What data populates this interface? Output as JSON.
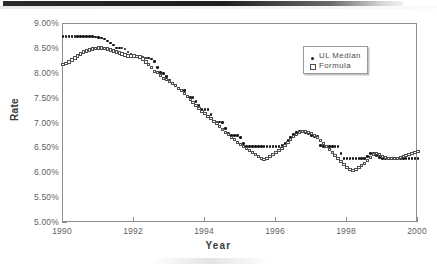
{
  "artifact": {
    "top_band": "scan-shadow-band"
  },
  "chart_data": {
    "type": "scatter",
    "title": "",
    "xlabel": "Year",
    "ylabel": "Rate",
    "xlim": [
      1990,
      2000
    ],
    "ylim": [
      5.0,
      9.0
    ],
    "ytick_labels": [
      "9.00%",
      "8.50%",
      "8.00%",
      "7.50%",
      "7.00%",
      "6.50%",
      "6.00%",
      "5.50%",
      "5.00%"
    ],
    "ytick_values": [
      9.0,
      8.5,
      8.0,
      7.5,
      7.0,
      6.5,
      6.0,
      5.5,
      5.0
    ],
    "xtick_labels": [
      "1990",
      "1992",
      "1994",
      "1996",
      "1998",
      "2000"
    ],
    "xtick_values": [
      1990,
      1992,
      1994,
      1996,
      1998,
      2000
    ],
    "grid": false,
    "legend_position": "upper-right",
    "y_unit": "percent",
    "x_step_months": 1,
    "series": [
      {
        "name": "UL Median",
        "marker": "filled-circle",
        "color": "#141414",
        "x_start": 1990.0,
        "values": [
          8.75,
          8.75,
          8.75,
          8.75,
          8.75,
          8.75,
          8.75,
          8.75,
          8.75,
          8.75,
          8.75,
          8.74,
          8.73,
          8.72,
          8.7,
          8.66,
          8.62,
          8.58,
          8.52,
          8.52,
          8.52,
          8.5,
          8.44,
          8.4,
          8.36,
          8.34,
          8.34,
          8.33,
          8.32,
          8.32,
          8.3,
          8.25,
          8.12,
          8.02,
          8.0,
          7.94,
          7.86,
          7.8,
          7.76,
          7.7,
          7.66,
          7.66,
          7.54,
          7.52,
          7.52,
          7.44,
          7.36,
          7.28,
          7.28,
          7.28,
          7.18,
          7.04,
          7.03,
          7.03,
          7.02,
          6.9,
          6.8,
          6.76,
          6.76,
          6.76,
          6.72,
          6.6,
          6.54,
          6.54,
          6.54,
          6.54,
          6.54,
          6.54,
          6.54,
          6.54,
          6.54,
          6.54,
          6.54,
          6.54,
          6.56,
          6.6,
          6.66,
          6.72,
          6.78,
          6.82,
          6.84,
          6.84,
          6.82,
          6.8,
          6.76,
          6.74,
          6.74,
          6.56,
          6.54,
          6.54,
          6.54,
          6.54,
          6.54,
          6.54,
          6.4,
          6.3,
          6.3,
          6.3,
          6.3,
          6.3,
          6.3,
          6.3,
          6.3,
          6.34,
          6.4,
          6.4,
          6.36,
          6.32,
          6.3,
          6.3,
          6.3,
          6.3,
          6.3,
          6.3,
          6.3,
          6.3,
          6.3,
          6.3,
          6.3,
          6.3,
          6.3,
          6.3,
          6.3,
          6.3,
          6.3,
          6.26,
          6.16,
          6.16,
          6.06,
          6.06,
          6.06,
          6.06,
          6.06,
          6.06,
          6.06,
          6.06,
          6.06,
          6.06,
          6.06,
          6.06,
          6.0,
          6.0,
          6.02,
          6.04,
          6.06,
          6.08
        ]
      },
      {
        "name": "Formula",
        "marker": "open-square",
        "color": "#4f4f4f",
        "x_start": 1990.0,
        "values": [
          8.18,
          8.2,
          8.24,
          8.28,
          8.32,
          8.36,
          8.4,
          8.44,
          8.46,
          8.48,
          8.5,
          8.51,
          8.52,
          8.52,
          8.51,
          8.5,
          8.48,
          8.46,
          8.44,
          8.42,
          8.4,
          8.38,
          8.36,
          8.36,
          8.36,
          8.35,
          8.34,
          8.3,
          8.24,
          8.18,
          8.12,
          8.04,
          8.02,
          7.96,
          7.9,
          7.88,
          7.84,
          7.8,
          7.76,
          7.7,
          7.66,
          7.6,
          7.54,
          7.48,
          7.42,
          7.36,
          7.3,
          7.24,
          7.2,
          7.14,
          7.1,
          7.04,
          7.0,
          6.94,
          6.88,
          6.82,
          6.78,
          6.72,
          6.68,
          6.62,
          6.58,
          6.54,
          6.5,
          6.46,
          6.42,
          6.38,
          6.34,
          6.3,
          6.28,
          6.3,
          6.34,
          6.38,
          6.42,
          6.46,
          6.5,
          6.56,
          6.62,
          6.68,
          6.74,
          6.78,
          6.82,
          6.84,
          6.84,
          6.82,
          6.8,
          6.76,
          6.72,
          6.66,
          6.6,
          6.54,
          6.48,
          6.42,
          6.36,
          6.3,
          6.24,
          6.18,
          6.12,
          6.08,
          6.06,
          6.08,
          6.12,
          6.16,
          6.2,
          6.26,
          6.32,
          6.38,
          6.4,
          6.38,
          6.34,
          6.32,
          6.3,
          6.3,
          6.3,
          6.3,
          6.32,
          6.34,
          6.36,
          6.38,
          6.4,
          6.42,
          6.44,
          6.46,
          6.48,
          6.48,
          6.46,
          6.44,
          6.4,
          6.36,
          6.32,
          6.28,
          6.24,
          6.2,
          6.16,
          6.12,
          5.96,
          5.9,
          5.8,
          5.76,
          5.7,
          5.64,
          5.62,
          5.62,
          5.64,
          5.68,
          5.74,
          5.8,
          5.86,
          5.92
        ]
      }
    ]
  }
}
